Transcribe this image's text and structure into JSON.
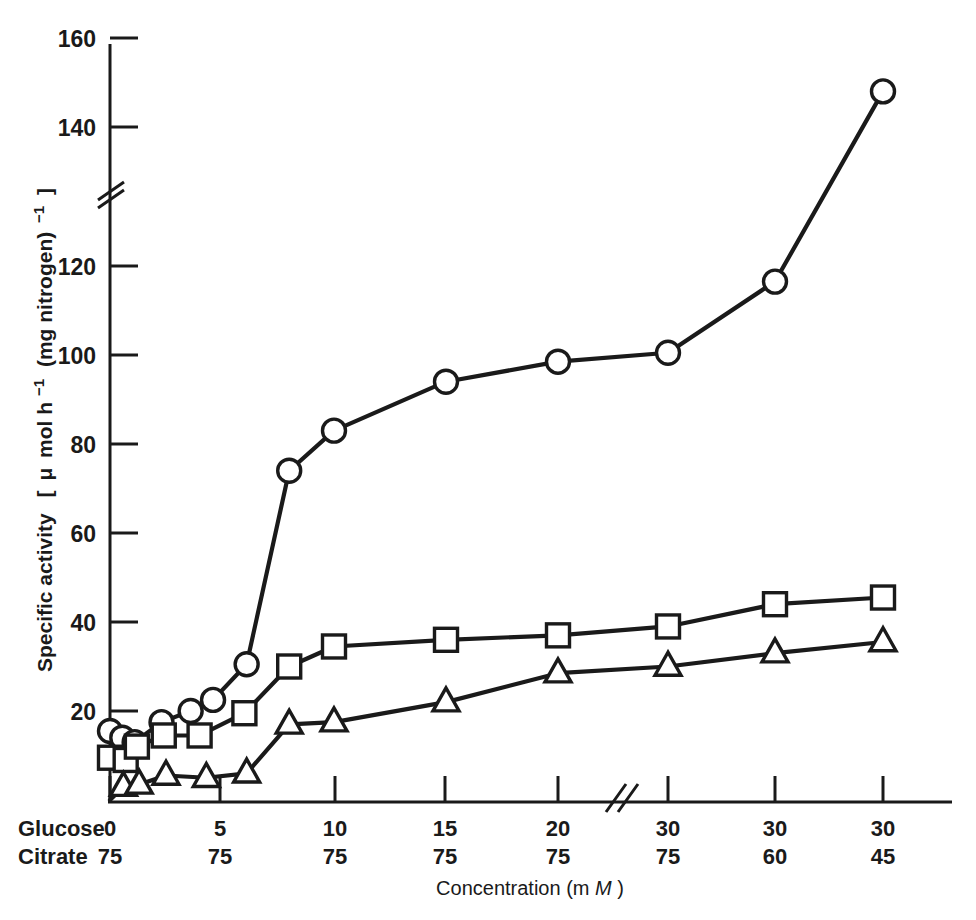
{
  "chart_data": {
    "type": "line",
    "title": "",
    "xlabel": "Concentration (mM)",
    "ylabel": "Specific activity  [ μ mol h⁻¹ (mg nitrogen) ⁻¹ ]",
    "ylabel_parts": {
      "lead": "Specific activity",
      "bracket_open": "[",
      "mu": "μ",
      "mol": "mol h",
      "sup1": "⁻¹",
      "paren": "(mg nitrogen)",
      "sup2": "⁻¹",
      "bracket_close": "]"
    },
    "xtitle_parts": {
      "lead": "Concentration (m",
      "italic_m": "M",
      "tail": ")"
    },
    "y_ticks": [
      20,
      40,
      60,
      80,
      100,
      120,
      140,
      160
    ],
    "ylim": [
      0,
      168
    ],
    "y_axis_break": {
      "between": [
        120,
        140
      ],
      "present": true
    },
    "x_axis_break": {
      "after_category_index": 4,
      "present": true
    },
    "grid": false,
    "legend": {
      "present": false,
      "position": "none"
    },
    "x_row_labels": [
      "Glucose",
      "Citrate"
    ],
    "x_categories": [
      {
        "glucose": "0",
        "citrate": "75"
      },
      {
        "glucose": "5",
        "citrate": "75"
      },
      {
        "glucose": "10",
        "citrate": "75"
      },
      {
        "glucose": "15",
        "citrate": "75"
      },
      {
        "glucose": "20",
        "citrate": "75"
      },
      {
        "glucose": "30",
        "citrate": "75"
      },
      {
        "glucose": "30",
        "citrate": "60"
      },
      {
        "glucose": "30",
        "citrate": "45"
      }
    ],
    "series": [
      {
        "name": "circle-series",
        "marker": "circle",
        "points": [
          {
            "x": 0.0,
            "y": 15.5
          },
          {
            "x": 0.55,
            "y": 14.0
          },
          {
            "x": 1.1,
            "y": 13.0
          },
          {
            "x": 2.3,
            "y": 17.5
          },
          {
            "x": 3.6,
            "y": 20.0
          },
          {
            "x": 4.6,
            "y": 22.5
          },
          {
            "x": 6.1,
            "y": 30.5
          },
          {
            "x": 8.0,
            "y": 74.0
          },
          {
            "x": 10.0,
            "y": 83.0
          },
          {
            "x": 15.0,
            "y": 94.0
          },
          {
            "x": 20.0,
            "y": 98.5
          },
          {
            "x": 30.0,
            "y": 100.5
          },
          {
            "x": 30.0,
            "y": 116.5
          },
          {
            "x": 30.0,
            "y": 148.0
          }
        ]
      },
      {
        "name": "square-series",
        "marker": "square",
        "points": [
          {
            "x": 0.0,
            "y": 9.5
          },
          {
            "x": 0.7,
            "y": 9.0
          },
          {
            "x": 1.2,
            "y": 12.0
          },
          {
            "x": 2.4,
            "y": 14.5
          },
          {
            "x": 4.0,
            "y": 14.5
          },
          {
            "x": 6.0,
            "y": 19.5
          },
          {
            "x": 8.0,
            "y": 30.0
          },
          {
            "x": 10.0,
            "y": 34.5
          },
          {
            "x": 15.0,
            "y": 36.0
          },
          {
            "x": 20.0,
            "y": 37.0
          },
          {
            "x": 30.0,
            "y": 39.0
          },
          {
            "x": 30.0,
            "y": 44.0
          },
          {
            "x": 30.0,
            "y": 45.5
          }
        ]
      },
      {
        "name": "triangle-series",
        "marker": "triangle",
        "points": [
          {
            "x": 0.0,
            "y": 0.0
          },
          {
            "x": 0.6,
            "y": 3.0
          },
          {
            "x": 1.3,
            "y": 3.5
          },
          {
            "x": 2.5,
            "y": 5.5
          },
          {
            "x": 4.3,
            "y": 5.0
          },
          {
            "x": 6.1,
            "y": 6.0
          },
          {
            "x": 8.0,
            "y": 17.0
          },
          {
            "x": 10.0,
            "y": 17.5
          },
          {
            "x": 15.0,
            "y": 22.0
          },
          {
            "x": 20.0,
            "y": 28.5
          },
          {
            "x": 30.0,
            "y": 30.0
          },
          {
            "x": 30.0,
            "y": 33.0
          },
          {
            "x": 30.0,
            "y": 35.5
          }
        ]
      }
    ]
  }
}
